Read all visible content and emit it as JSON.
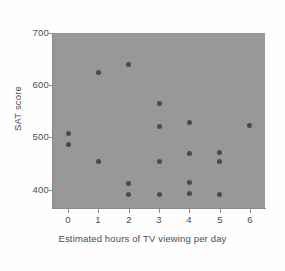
{
  "chart_data": {
    "type": "scatter",
    "title": "",
    "xlabel": "Estimated hours of TV viewing per day",
    "ylabel": "SAT score",
    "xlim": [
      -0.5,
      6.5
    ],
    "ylim": [
      365,
      700
    ],
    "xticks": [
      0,
      1,
      2,
      3,
      4,
      5,
      6
    ],
    "xtick_labels": [
      "0",
      "1",
      "2",
      "3",
      "4",
      "5",
      "6"
    ],
    "yticks": [
      400,
      500,
      600,
      700
    ],
    "ytick_labels": [
      "400",
      "500",
      "600",
      "700"
    ],
    "grid": false,
    "legend": null,
    "marker": "filled-circle",
    "marker_color": "#4a4a4a",
    "panel_color": "#989898",
    "points": [
      {
        "x": 0,
        "y": 508
      },
      {
        "x": 0,
        "y": 486
      },
      {
        "x": 1,
        "y": 625
      },
      {
        "x": 1,
        "y": 454
      },
      {
        "x": 2,
        "y": 639
      },
      {
        "x": 2,
        "y": 412
      },
      {
        "x": 2,
        "y": 390
      },
      {
        "x": 3,
        "y": 566
      },
      {
        "x": 3,
        "y": 521
      },
      {
        "x": 3,
        "y": 454
      },
      {
        "x": 3,
        "y": 390
      },
      {
        "x": 4,
        "y": 529
      },
      {
        "x": 4,
        "y": 470
      },
      {
        "x": 4,
        "y": 414
      },
      {
        "x": 4,
        "y": 392
      },
      {
        "x": 5,
        "y": 472
      },
      {
        "x": 5,
        "y": 454
      },
      {
        "x": 5,
        "y": 390
      },
      {
        "x": 6,
        "y": 523
      }
    ]
  }
}
